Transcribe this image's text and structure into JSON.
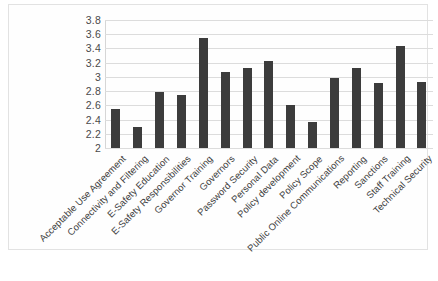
{
  "chart_data": {
    "type": "bar",
    "title": "",
    "subtitle": "",
    "xlabel": "",
    "ylabel": "",
    "ylim": [
      2,
      3.8
    ],
    "ytick_labels": [
      "3.8",
      "3.6",
      "3.4",
      "3.2",
      "3",
      "2.8",
      "2.6",
      "2.4",
      "2.2",
      "2"
    ],
    "ytick_values": [
      3.8,
      3.6,
      3.4,
      3.2,
      3.0,
      2.8,
      2.6,
      2.4,
      2.2,
      2.0
    ],
    "grid": true,
    "legend": "none",
    "bar_color": "#3c3c3c",
    "gridline_color": "#dcdcdc",
    "categories": [
      "Acceptable Use Agreement",
      "Connectivity and Filtering",
      "E-Safety Education",
      "E-Safety Responsibilities",
      "Governor Training",
      "Governors",
      "Password Security",
      "Personal Data",
      "Policy development",
      "Policy Scope",
      "Public Online Communications",
      "Reporting",
      "Sanctions",
      "Staff Training",
      "Technical Security"
    ],
    "values": [
      2.55,
      2.3,
      2.79,
      2.75,
      3.55,
      3.07,
      3.12,
      3.23,
      2.61,
      2.36,
      2.98,
      3.13,
      2.92,
      3.44,
      2.93
    ]
  }
}
